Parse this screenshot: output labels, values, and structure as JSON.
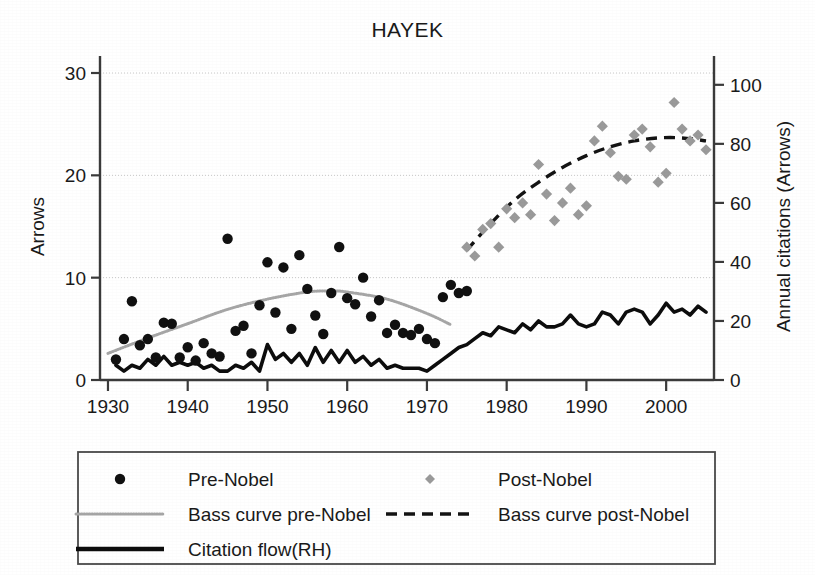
{
  "chart_data": {
    "type": "scatter",
    "title": "HAYEK",
    "xlabel": "",
    "ylabel": "Arrows",
    "y2label": "Annual citations (Arrows)",
    "xlim": [
      1929,
      2006
    ],
    "ylim": [
      0,
      30
    ],
    "y2lim": [
      0,
      104
    ],
    "xticks": [
      1930,
      1940,
      1950,
      1960,
      1970,
      1980,
      1990,
      2000
    ],
    "yticks": [
      0,
      10,
      20,
      30
    ],
    "y2ticks": [
      0,
      20,
      40,
      60,
      80,
      100
    ],
    "grid": "horizontal-dotted",
    "legend_position": "below-plot",
    "series": [
      {
        "name": "Pre-Nobel",
        "type": "scatter",
        "marker": "circle",
        "color": "#111111",
        "axis": "left",
        "points": [
          [
            1931,
            2.0
          ],
          [
            1932,
            4.0
          ],
          [
            1933,
            7.7
          ],
          [
            1934,
            3.4
          ],
          [
            1935,
            4.0
          ],
          [
            1936,
            2.2
          ],
          [
            1937,
            5.6
          ],
          [
            1938,
            5.5
          ],
          [
            1939,
            2.2
          ],
          [
            1940,
            3.2
          ],
          [
            1941,
            1.9
          ],
          [
            1942,
            3.6
          ],
          [
            1943,
            2.6
          ],
          [
            1944,
            2.3
          ],
          [
            1945,
            13.8
          ],
          [
            1946,
            4.8
          ],
          [
            1947,
            5.3
          ],
          [
            1948,
            2.6
          ],
          [
            1949,
            7.3
          ],
          [
            1950,
            11.5
          ],
          [
            1951,
            6.6
          ],
          [
            1952,
            11.0
          ],
          [
            1953,
            5.0
          ],
          [
            1954,
            12.2
          ],
          [
            1955,
            8.9
          ],
          [
            1956,
            6.3
          ],
          [
            1957,
            4.5
          ],
          [
            1958,
            8.5
          ],
          [
            1959,
            13.0
          ],
          [
            1960,
            8.0
          ],
          [
            1961,
            7.4
          ],
          [
            1962,
            10.0
          ],
          [
            1963,
            6.2
          ],
          [
            1964,
            7.8
          ],
          [
            1965,
            4.6
          ],
          [
            1966,
            5.4
          ],
          [
            1967,
            4.6
          ],
          [
            1968,
            4.4
          ],
          [
            1969,
            5.0
          ],
          [
            1970,
            4.0
          ],
          [
            1971,
            3.6
          ],
          [
            1972,
            8.1
          ],
          [
            1973,
            9.3
          ],
          [
            1974,
            8.5
          ],
          [
            1975,
            8.7
          ]
        ]
      },
      {
        "name": "Post-Nobel",
        "type": "scatter",
        "marker": "diamond",
        "color": "#9a9a9a",
        "axis": "right",
        "points": [
          [
            1975,
            45
          ],
          [
            1976,
            42
          ],
          [
            1977,
            51
          ],
          [
            1978,
            53
          ],
          [
            1979,
            45
          ],
          [
            1980,
            58
          ],
          [
            1981,
            55
          ],
          [
            1982,
            60
          ],
          [
            1983,
            56
          ],
          [
            1984,
            73
          ],
          [
            1985,
            63
          ],
          [
            1986,
            54
          ],
          [
            1987,
            60
          ],
          [
            1988,
            65
          ],
          [
            1989,
            56
          ],
          [
            1990,
            59
          ],
          [
            1991,
            81
          ],
          [
            1992,
            86
          ],
          [
            1993,
            77
          ],
          [
            1994,
            69
          ],
          [
            1995,
            68
          ],
          [
            1996,
            83
          ],
          [
            1997,
            85
          ],
          [
            1998,
            79
          ],
          [
            1999,
            67
          ],
          [
            2000,
            70
          ],
          [
            2001,
            94
          ],
          [
            2002,
            85
          ],
          [
            2003,
            81
          ],
          [
            2004,
            83
          ],
          [
            2005,
            78
          ]
        ]
      },
      {
        "name": "Bass curve pre-Nobel",
        "type": "line",
        "style": "dotted-gray",
        "color": "#a6a6a6",
        "axis": "left",
        "points": [
          [
            1930,
            2.6
          ],
          [
            1935,
            4.1
          ],
          [
            1940,
            5.5
          ],
          [
            1945,
            6.9
          ],
          [
            1950,
            7.9
          ],
          [
            1955,
            8.6
          ],
          [
            1958,
            8.7
          ],
          [
            1960,
            8.6
          ],
          [
            1965,
            7.9
          ],
          [
            1970,
            6.5
          ],
          [
            1973,
            5.4
          ]
        ]
      },
      {
        "name": "Bass curve post-Nobel",
        "type": "line",
        "style": "dashed-black",
        "color": "#141414",
        "axis": "right",
        "points": [
          [
            1975,
            44
          ],
          [
            1978,
            53
          ],
          [
            1981,
            61
          ],
          [
            1984,
            67
          ],
          [
            1987,
            72
          ],
          [
            1990,
            76
          ],
          [
            1993,
            79
          ],
          [
            1996,
            81
          ],
          [
            1999,
            82
          ],
          [
            2002,
            82
          ],
          [
            2005,
            81
          ]
        ]
      },
      {
        "name": "Citation flow(RH)",
        "type": "line",
        "style": "solid-thick-black",
        "color": "#0d0d0d",
        "axis": "right",
        "points": [
          [
            1931,
            5
          ],
          [
            1932,
            3
          ],
          [
            1933,
            5
          ],
          [
            1934,
            4
          ],
          [
            1935,
            7
          ],
          [
            1936,
            5
          ],
          [
            1937,
            8
          ],
          [
            1938,
            5
          ],
          [
            1939,
            6
          ],
          [
            1940,
            5
          ],
          [
            1941,
            6
          ],
          [
            1942,
            4
          ],
          [
            1943,
            5
          ],
          [
            1944,
            3
          ],
          [
            1945,
            3
          ],
          [
            1946,
            5
          ],
          [
            1947,
            4
          ],
          [
            1948,
            6
          ],
          [
            1949,
            3
          ],
          [
            1950,
            12
          ],
          [
            1951,
            7
          ],
          [
            1952,
            9
          ],
          [
            1953,
            6
          ],
          [
            1954,
            9
          ],
          [
            1955,
            5
          ],
          [
            1956,
            11
          ],
          [
            1957,
            6
          ],
          [
            1958,
            10
          ],
          [
            1959,
            6
          ],
          [
            1960,
            10
          ],
          [
            1961,
            6
          ],
          [
            1962,
            8
          ],
          [
            1963,
            5
          ],
          [
            1964,
            7
          ],
          [
            1965,
            4
          ],
          [
            1966,
            5
          ],
          [
            1967,
            4
          ],
          [
            1968,
            4
          ],
          [
            1969,
            4
          ],
          [
            1970,
            3
          ],
          [
            1971,
            5
          ],
          [
            1972,
            7
          ],
          [
            1973,
            9
          ],
          [
            1974,
            11
          ],
          [
            1975,
            12
          ],
          [
            1976,
            14
          ],
          [
            1977,
            16
          ],
          [
            1978,
            15
          ],
          [
            1979,
            18
          ],
          [
            1980,
            17
          ],
          [
            1981,
            16
          ],
          [
            1982,
            19
          ],
          [
            1983,
            17
          ],
          [
            1984,
            20
          ],
          [
            1985,
            18
          ],
          [
            1986,
            18
          ],
          [
            1987,
            19
          ],
          [
            1988,
            22
          ],
          [
            1989,
            19
          ],
          [
            1990,
            18
          ],
          [
            1991,
            19
          ],
          [
            1992,
            23
          ],
          [
            1993,
            22
          ],
          [
            1994,
            19
          ],
          [
            1995,
            23
          ],
          [
            1996,
            24
          ],
          [
            1997,
            23
          ],
          [
            1998,
            19
          ],
          [
            1999,
            22
          ],
          [
            2000,
            26
          ],
          [
            2001,
            23
          ],
          [
            2002,
            24
          ],
          [
            2003,
            22
          ],
          [
            2004,
            25
          ],
          [
            2005,
            23
          ]
        ]
      }
    ],
    "legend": [
      {
        "label": "Pre-Nobel",
        "marker": "circle",
        "color": "#111111"
      },
      {
        "label": "Post-Nobel",
        "marker": "diamond",
        "color": "#9a9a9a"
      },
      {
        "label": "Bass curve pre-Nobel",
        "marker": "dotted-line",
        "color": "#a6a6a6"
      },
      {
        "label": "Bass curve post-Nobel",
        "marker": "dashed-line",
        "color": "#141414"
      },
      {
        "label": "Citation flow(RH)",
        "marker": "solid-line",
        "color": "#0d0d0d"
      }
    ]
  }
}
